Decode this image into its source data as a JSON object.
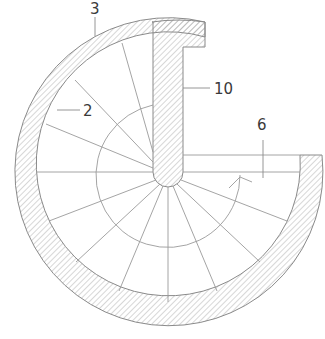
{
  "diagram": {
    "type": "spiral-staircase-plan",
    "labels": [
      {
        "id": "3",
        "text": "3",
        "target": "outer-wall"
      },
      {
        "id": "2",
        "text": "2",
        "target": "inner-wall-face"
      },
      {
        "id": "10",
        "text": "10",
        "target": "central-wall"
      },
      {
        "id": "6",
        "text": "6",
        "target": "landing-step"
      }
    ],
    "tread_count": 14,
    "colors": {
      "line": "#8a8a8a",
      "hatch": "#9a9a9a",
      "text": "#3a3a3a"
    }
  }
}
